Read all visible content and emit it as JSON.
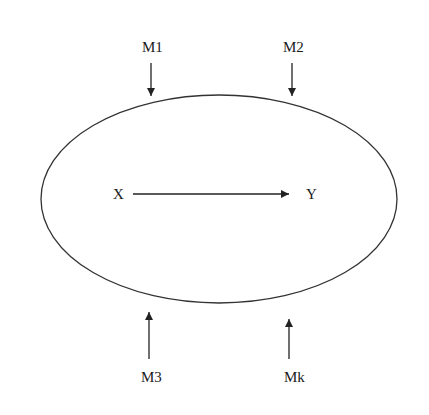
{
  "diagram": {
    "container": {
      "shape": "ellipse",
      "cx": 219,
      "cy": 199,
      "rx": 178,
      "ry": 104,
      "stroke": "#333333"
    },
    "inner": {
      "source": {
        "label": "X",
        "x": 113,
        "y": 199
      },
      "target": {
        "label": "Y",
        "x": 306,
        "y": 199
      },
      "arrow": {
        "x1": 133,
        "x2": 289,
        "y": 194,
        "direction": "right"
      }
    },
    "moderators": [
      {
        "id": "m1",
        "label": "M1",
        "text_x": 142,
        "text_y": 52,
        "arrow_x": 151,
        "arrow_from": 63,
        "arrow_to": 96,
        "direction": "down"
      },
      {
        "id": "m2",
        "label": "M2",
        "text_x": 283,
        "text_y": 52,
        "arrow_x": 292,
        "arrow_from": 63,
        "arrow_to": 96,
        "direction": "down"
      },
      {
        "id": "m3",
        "label": "M3",
        "text_x": 141,
        "text_y": 382,
        "arrow_x": 149,
        "arrow_from": 359,
        "arrow_to": 312,
        "direction": "up"
      },
      {
        "id": "mk",
        "label": "Mk",
        "text_x": 284,
        "text_y": 382,
        "arrow_x": 289,
        "arrow_from": 359,
        "arrow_to": 319,
        "direction": "up"
      }
    ],
    "colors": {
      "line": "#222222",
      "text": "#1a1a1a",
      "background": "#ffffff"
    }
  }
}
